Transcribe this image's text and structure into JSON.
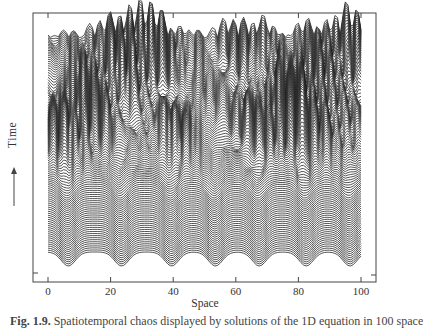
{
  "chart_data": {
    "type": "waterfall",
    "title": "",
    "xlabel": "Space",
    "ylabel": "Time",
    "ylabel_arrow": "up",
    "x_ticks": [
      0,
      20,
      40,
      60,
      80,
      100
    ],
    "x_tick_labels": [
      "0",
      "20",
      "40",
      "60",
      "80",
      "100"
    ],
    "xlim": [
      0,
      100
    ],
    "grid": false,
    "legend": null,
    "num_traces": 110,
    "lower_regime_trough_positions": [
      5,
      22,
      38,
      52,
      66,
      81,
      95
    ],
    "upper_regime": "chaotic"
  },
  "axes": {
    "tick_labels": [
      "0",
      "20",
      "40",
      "60",
      "80",
      "100"
    ]
  },
  "labels": {
    "x": "Space",
    "y": "Time",
    "y_arrow": "⟶"
  },
  "caption": {
    "prefix": "Fig. 1.9.",
    "text": "Spatiotemporal chaos displayed by solutions of the 1D equation in 100 space"
  }
}
